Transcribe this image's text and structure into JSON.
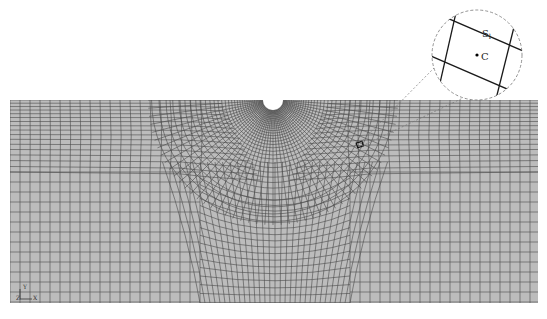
{
  "figure": {
    "type": "finite-element-mesh",
    "colors": {
      "background": "#ffffff",
      "mesh_fill": "#bcbcbc",
      "mesh_line": "#4a4a4a",
      "callout_line": "#1a1a1a",
      "dashed_line": "#777777"
    },
    "mesh": {
      "left": 10,
      "right": 538,
      "top": 100,
      "bottom": 303,
      "notch": {
        "cx": 273,
        "cy": 100,
        "r": 10
      },
      "block_split_y": 172,
      "center_block_left": 200,
      "center_block_right": 350
    },
    "callout": {
      "cx": 477,
      "cy": 55,
      "r": 45,
      "label_edge": "S",
      "label_edge_sub": "l",
      "label_center": "C",
      "source_x": 360,
      "source_y": 145
    },
    "axis_triad": {
      "y_label": "Y",
      "z_label": "Z",
      "x_label": "X"
    }
  }
}
